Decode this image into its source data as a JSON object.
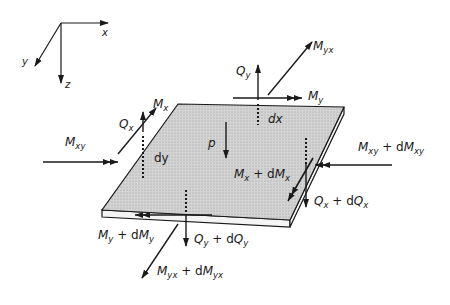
{
  "figure": {
    "colors": {
      "ink": "#1a1a1a",
      "plate_fill": "#c8c8c8",
      "plate_edge": "#f2f2f2",
      "background": "#ffffff"
    }
  },
  "axes": {
    "x_label": "x",
    "y_label": "y",
    "z_label": "z"
  },
  "labels": {
    "Qy": {
      "main": "Q",
      "sub": "y"
    },
    "Myx": {
      "main": "M",
      "sub": "yx"
    },
    "My": {
      "main": "M",
      "sub": "y"
    },
    "dx": {
      "text": "dx"
    },
    "Mx": {
      "main": "M",
      "sub": "x"
    },
    "Qx": {
      "main": "Q",
      "sub": "x"
    },
    "Mxy": {
      "main": "M",
      "sub": "xy"
    },
    "dy": {
      "text": "dy"
    },
    "p": {
      "text": "p"
    },
    "Mxy_dMxy": {
      "main": "M",
      "sub": "xy",
      "plus": " + d",
      "main2": "M",
      "sub2": "xy"
    },
    "Mx_dMx": {
      "main": "M",
      "sub": "x",
      "plus": " + d",
      "main2": "M",
      "sub2": "x"
    },
    "Qx_dQx": {
      "main": "Q",
      "sub": "x",
      "plus": " + d",
      "main2": "Q",
      "sub2": "x"
    },
    "My_dMy": {
      "main": "M",
      "sub": "y",
      "plus": " + d",
      "main2": "M",
      "sub2": "y"
    },
    "Qy_dQy": {
      "main": "Q",
      "sub": "y",
      "plus": " + d",
      "main2": "Q",
      "sub2": "y"
    },
    "Myx_dMyx": {
      "main": "M",
      "sub": "yx",
      "plus": " + d",
      "main2": "M",
      "sub2": "yx"
    }
  }
}
